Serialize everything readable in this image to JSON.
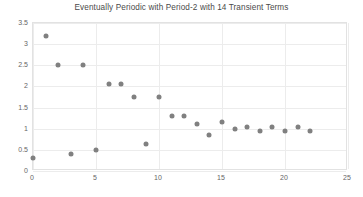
{
  "chart_data": {
    "type": "scatter",
    "title": "Eventually Periodic with Period-2 with 14 Transient Terms",
    "xlabel": "",
    "ylabel": "",
    "xlim": [
      0,
      25
    ],
    "ylim": [
      0,
      3.5
    ],
    "xticks": [
      0,
      5,
      10,
      15,
      20,
      25
    ],
    "yticks": [
      0,
      0.5,
      1,
      1.5,
      2,
      2.5,
      3,
      3.5
    ],
    "grid": true,
    "legend": false,
    "marker_color": "#808080",
    "series": [
      {
        "name": "sequence",
        "points": [
          [
            0,
            0.3
          ],
          [
            1,
            3.2
          ],
          [
            2,
            2.5
          ],
          [
            3,
            0.4
          ],
          [
            4,
            2.5
          ],
          [
            5,
            0.5
          ],
          [
            6,
            2.05
          ],
          [
            7,
            2.05
          ],
          [
            8,
            1.75
          ],
          [
            9,
            0.65
          ],
          [
            10,
            1.75
          ],
          [
            11,
            1.3
          ],
          [
            12,
            1.3
          ],
          [
            13,
            1.1
          ],
          [
            14,
            0.85
          ],
          [
            15,
            1.15
          ],
          [
            16,
            1.0
          ],
          [
            17,
            1.05
          ],
          [
            18,
            0.95
          ],
          [
            19,
            1.05
          ],
          [
            20,
            0.95
          ],
          [
            21,
            1.05
          ],
          [
            22,
            0.95
          ]
        ]
      }
    ]
  },
  "axis": {
    "x_labels": [
      "0",
      "5",
      "10",
      "15",
      "20",
      "25"
    ],
    "y_labels": [
      "0",
      "0.5",
      "1",
      "1.5",
      "2",
      "2.5",
      "3",
      "3.5"
    ]
  }
}
